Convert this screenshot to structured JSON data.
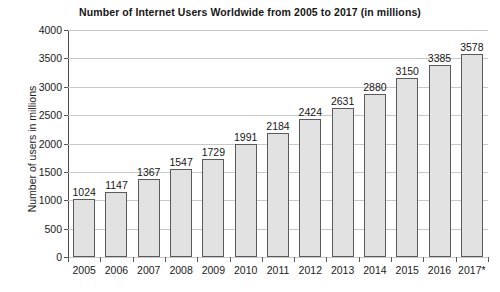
{
  "chart_data": {
    "type": "bar",
    "title": "Number of Internet Users Worldwide from 2005 to 2017 (in millions)",
    "xlabel": "",
    "ylabel": "Number of users in millions",
    "categories": [
      "2005",
      "2006",
      "2007",
      "2008",
      "2009",
      "2010",
      "2011",
      "2012",
      "2013",
      "2014",
      "2015",
      "2016",
      "2017*"
    ],
    "values": [
      1024,
      1147,
      1367,
      1547,
      1729,
      1991,
      2184,
      2424,
      2631,
      2880,
      3150,
      3385,
      3578
    ],
    "ylim": [
      0,
      4000
    ],
    "yticks": [
      0,
      500,
      1000,
      1500,
      2000,
      2500,
      3000,
      3500,
      4000
    ],
    "ytick_labels": [
      "0",
      "500",
      "1000",
      "1500",
      "2000",
      "2500",
      "3000",
      "3500",
      "4000"
    ],
    "grid": true,
    "legend": false,
    "data_labels": [
      "1024",
      "1147",
      "1367",
      "1547",
      "1729",
      "1991",
      "2184",
      "2424",
      "2631",
      "2880",
      "3150",
      "3385",
      "3578"
    ],
    "bar_fill_color": "#e2e2e2",
    "bar_border_color": "#5a5a5a",
    "gridline_color": "#c8c8c8",
    "axis_color": "#4a4a4a",
    "background_color": "#ffffff",
    "text_color": "#1a1a1a"
  }
}
